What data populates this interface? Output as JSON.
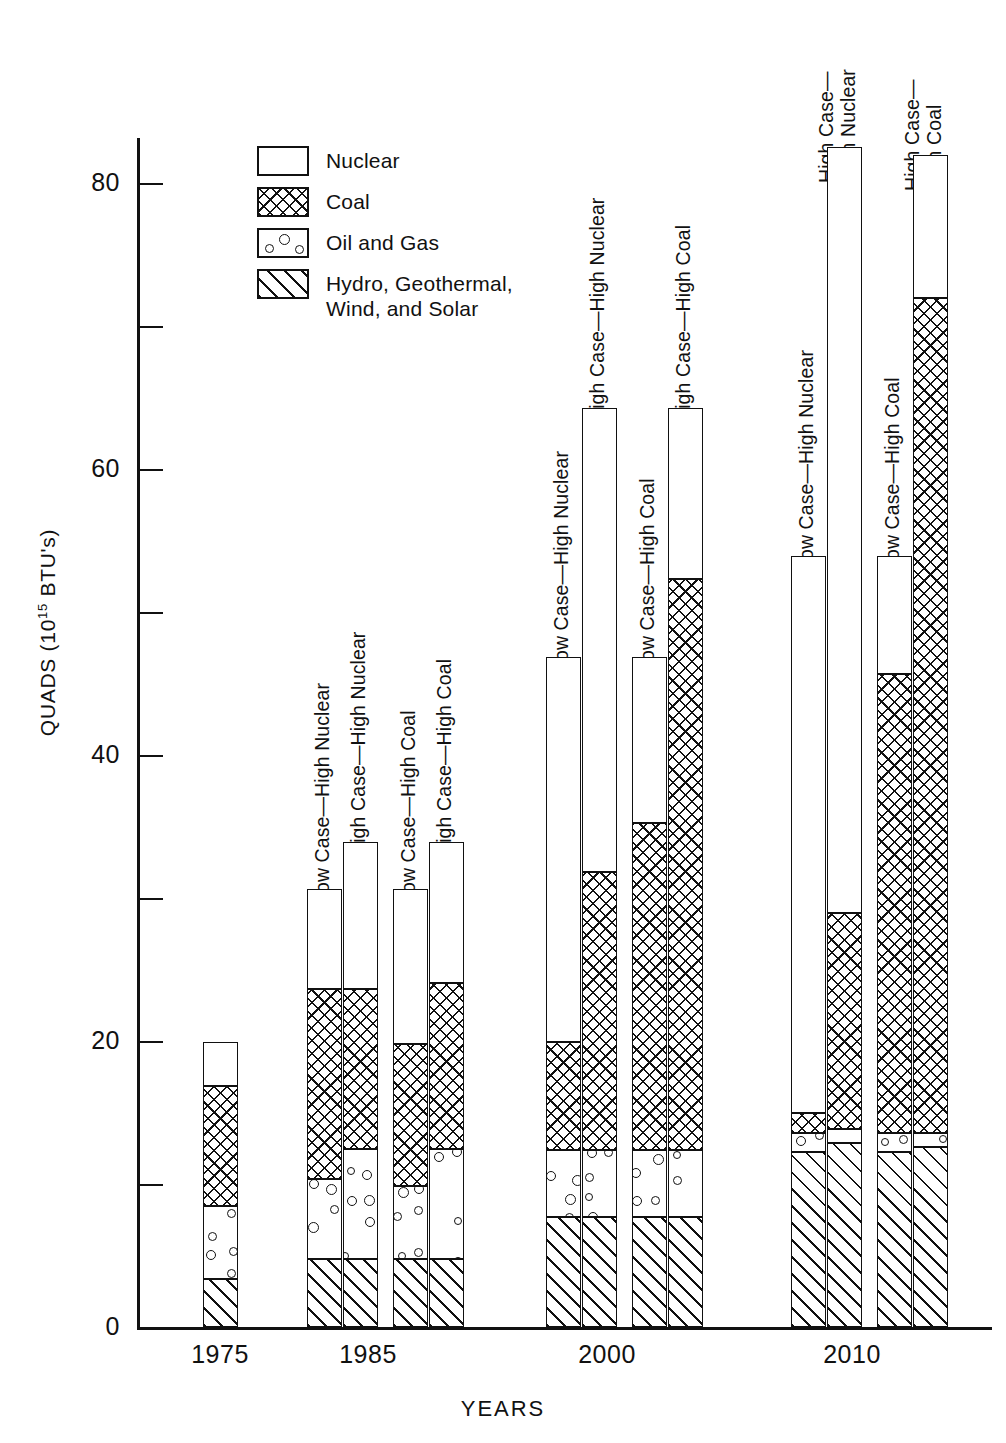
{
  "chart_data": {
    "type": "bar",
    "stacked": true,
    "title": "",
    "subtitle": "",
    "xlabel": "YEARS",
    "ylabel": "QUADS (10^15 BTU's)",
    "ylabel_parts": {
      "pre": "QUADS (10",
      "sup": "15",
      "post": " BTU's)"
    },
    "ylim": [
      0,
      85
    ],
    "yticks": [
      0,
      20,
      40,
      60,
      80
    ],
    "ytick_labels": [
      "0",
      "20",
      "40",
      "60",
      "80"
    ],
    "yminor_ticks": [
      10,
      30,
      50,
      70
    ],
    "grid": false,
    "legend_position": "upper-left-inside",
    "series": [
      {
        "name": "Nuclear",
        "fill": "white"
      },
      {
        "name": "Coal",
        "fill": "cross-hatch"
      },
      {
        "name": "Oil and Gas",
        "fill": "dotted-circles"
      },
      {
        "name": "Hydro, Geothermal, Wind, and Solar",
        "fill": "diagonal-hatch"
      }
    ],
    "categories": [
      "1975",
      "1985",
      "2000",
      "2010"
    ],
    "bars": [
      {
        "group": "1975",
        "label": "",
        "label_lines": [],
        "total": 20.0,
        "segments": [
          {
            "series": "Hydro, Geothermal, Wind, and Solar",
            "value": 3.4,
            "cum_top": 3.4
          },
          {
            "series": "Oil and Gas",
            "value": 5.1,
            "cum_top": 8.5
          },
          {
            "series": "Coal",
            "value": 8.4,
            "cum_top": 16.9
          },
          {
            "series": "Nuclear",
            "value": 3.1,
            "cum_top": 20.0
          }
        ]
      },
      {
        "group": "1985",
        "label": "Low Case—High Nuclear",
        "label_lines": [
          "Low Case—High Nuclear"
        ],
        "total": 30.7,
        "segments": [
          {
            "series": "Hydro, Geothermal, Wind, and Solar",
            "value": 4.8,
            "cum_top": 4.8
          },
          {
            "series": "Oil and Gas",
            "value": 5.6,
            "cum_top": 10.4
          },
          {
            "series": "Coal",
            "value": 13.3,
            "cum_top": 23.7
          },
          {
            "series": "Nuclear",
            "value": 7.0,
            "cum_top": 30.7
          }
        ]
      },
      {
        "group": "1985",
        "label": "High Case—High Nuclear",
        "label_lines": [
          "High Case—High Nuclear"
        ],
        "total": 34.0,
        "segments": [
          {
            "series": "Hydro, Geothermal, Wind, and Solar",
            "value": 4.8,
            "cum_top": 4.8
          },
          {
            "series": "Oil and Gas",
            "value": 7.7,
            "cum_top": 12.5
          },
          {
            "series": "Coal",
            "value": 11.2,
            "cum_top": 23.7
          },
          {
            "series": "Nuclear",
            "value": 10.3,
            "cum_top": 34.0
          }
        ]
      },
      {
        "group": "1985",
        "label": "Low Case—High Coal",
        "label_lines": [
          "Low Case—High Coal"
        ],
        "total": 30.7,
        "segments": [
          {
            "series": "Hydro, Geothermal, Wind, and Solar",
            "value": 4.8,
            "cum_top": 4.8
          },
          {
            "series": "Oil and Gas",
            "value": 5.1,
            "cum_top": 9.9
          },
          {
            "series": "Coal",
            "value": 9.9,
            "cum_top": 19.8
          },
          {
            "series": "Nuclear",
            "value": 10.9,
            "cum_top": 30.7
          }
        ]
      },
      {
        "group": "1985",
        "label": "High Case—High Coal",
        "label_lines": [
          "High Case—High Coal"
        ],
        "total": 34.0,
        "segments": [
          {
            "series": "Hydro, Geothermal, Wind, and Solar",
            "value": 4.8,
            "cum_top": 4.8
          },
          {
            "series": "Oil and Gas",
            "value": 7.7,
            "cum_top": 12.5
          },
          {
            "series": "Coal",
            "value": 11.6,
            "cum_top": 24.1
          },
          {
            "series": "Nuclear",
            "value": 9.9,
            "cum_top": 34.0
          }
        ]
      },
      {
        "group": "2000",
        "label": "Low Case—High Nuclear",
        "label_lines": [
          "Low Case—High Nuclear"
        ],
        "total": 46.9,
        "segments": [
          {
            "series": "Hydro, Geothermal, Wind, and Solar",
            "value": 7.7,
            "cum_top": 7.7
          },
          {
            "series": "Oil and Gas",
            "value": 4.7,
            "cum_top": 12.4
          },
          {
            "series": "Coal",
            "value": 7.6,
            "cum_top": 20.0
          },
          {
            "series": "Nuclear",
            "value": 26.9,
            "cum_top": 46.9
          }
        ]
      },
      {
        "group": "2000",
        "label": "High Case—High Nuclear",
        "label_lines": [
          "High Case—High Nuclear"
        ],
        "total": 64.3,
        "segments": [
          {
            "series": "Hydro, Geothermal, Wind, and Solar",
            "value": 7.7,
            "cum_top": 7.7
          },
          {
            "series": "Oil and Gas",
            "value": 4.7,
            "cum_top": 12.4
          },
          {
            "series": "Coal",
            "value": 19.5,
            "cum_top": 31.9
          },
          {
            "series": "Nuclear",
            "value": 32.4,
            "cum_top": 64.3
          }
        ]
      },
      {
        "group": "2000",
        "label": "Low Case—High Coal",
        "label_lines": [
          "Low Case—High Coal"
        ],
        "total": 46.9,
        "segments": [
          {
            "series": "Hydro, Geothermal, Wind, and Solar",
            "value": 7.7,
            "cum_top": 7.7
          },
          {
            "series": "Oil and Gas",
            "value": 4.7,
            "cum_top": 12.4
          },
          {
            "series": "Coal",
            "value": 22.9,
            "cum_top": 35.3
          },
          {
            "series": "Nuclear",
            "value": 11.6,
            "cum_top": 46.9
          }
        ]
      },
      {
        "group": "2000",
        "label": "High Case—High Coal",
        "label_lines": [
          "High Case—High Coal"
        ],
        "total": 64.3,
        "segments": [
          {
            "series": "Hydro, Geothermal, Wind, and Solar",
            "value": 7.7,
            "cum_top": 7.7
          },
          {
            "series": "Oil and Gas",
            "value": 4.7,
            "cum_top": 12.4
          },
          {
            "series": "Coal",
            "value": 40.0,
            "cum_top": 52.4
          },
          {
            "series": "Nuclear",
            "value": 11.9,
            "cum_top": 64.3
          }
        ]
      },
      {
        "group": "2010",
        "label": "Low Case—High Nuclear",
        "label_lines": [
          "Low Case—High Nuclear"
        ],
        "total": 54.0,
        "segments": [
          {
            "series": "Hydro, Geothermal, Wind, and Solar",
            "value": 12.3,
            "cum_top": 12.3
          },
          {
            "series": "Oil and Gas",
            "value": 1.3,
            "cum_top": 13.6
          },
          {
            "series": "Coal",
            "value": 1.4,
            "cum_top": 15.0
          },
          {
            "series": "Nuclear",
            "value": 39.0,
            "cum_top": 54.0
          }
        ]
      },
      {
        "group": "2010",
        "label": "High Case— High Nuclear",
        "label_lines": [
          "High Case—",
          "High Nuclear"
        ],
        "total": 82.6,
        "segments": [
          {
            "series": "Hydro, Geothermal, Wind, and Solar",
            "value": 12.9,
            "cum_top": 12.9
          },
          {
            "series": "Oil and Gas",
            "value": 1.0,
            "cum_top": 13.9
          },
          {
            "series": "Coal",
            "value": 15.1,
            "cum_top": 29.0
          },
          {
            "series": "Nuclear",
            "value": 53.6,
            "cum_top": 82.6
          }
        ]
      },
      {
        "group": "2010",
        "label": "Low Case—High Coal",
        "label_lines": [
          "Low Case—High Coal"
        ],
        "total": 54.0,
        "segments": [
          {
            "series": "Hydro, Geothermal, Wind, and Solar",
            "value": 12.3,
            "cum_top": 12.3
          },
          {
            "series": "Oil and Gas",
            "value": 1.3,
            "cum_top": 13.6
          },
          {
            "series": "Coal",
            "value": 32.1,
            "cum_top": 45.7
          },
          {
            "series": "Nuclear",
            "value": 8.3,
            "cum_top": 54.0
          }
        ]
      },
      {
        "group": "2010",
        "label": "High Case— High Coal",
        "label_lines": [
          "High Case—",
          "High Coal"
        ],
        "total": 82.0,
        "segments": [
          {
            "series": "Hydro, Geothermal, Wind, and Solar",
            "value": 12.6,
            "cum_top": 12.6
          },
          {
            "series": "Oil and Gas",
            "value": 1.0,
            "cum_top": 13.6
          },
          {
            "series": "Coal",
            "value": 58.4,
            "cum_top": 72.0
          },
          {
            "series": "Nuclear",
            "value": 10.0,
            "cum_top": 82.0
          }
        ]
      }
    ]
  },
  "legend": {
    "items": [
      {
        "label": "Nuclear",
        "fill": "nuclear"
      },
      {
        "label": "Coal",
        "fill": "coal"
      },
      {
        "label": "Oil and Gas",
        "fill": "oil"
      },
      {
        "label": "Hydro, Geothermal,\nWind, and Solar",
        "fill": "hydro"
      }
    ]
  },
  "axes": {
    "y_label_pre": "QUADS (10",
    "y_label_sup": "15",
    "y_label_post": " BTU's)",
    "x_label": "YEARS",
    "y_ticks": [
      "80",
      "60",
      "40",
      "20",
      "0"
    ],
    "x_ticks": [
      "1975",
      "1985",
      "2000",
      "2010"
    ]
  }
}
